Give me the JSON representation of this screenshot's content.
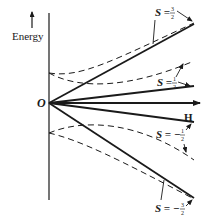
{
  "diagram": {
    "type": "zeeman-energy-level-splitting",
    "axes": {
      "y_label": "Energy",
      "x_label": "H",
      "origin_label": "O"
    },
    "levels": [
      {
        "label_prefix": "S = ",
        "sign": "",
        "num": "3",
        "den": "2",
        "style": "solid",
        "note": "linear, steepest rising"
      },
      {
        "label_prefix": "S = ",
        "sign": "",
        "num": "1",
        "den": "2",
        "style": "solid",
        "note": "linear, shallow rising"
      },
      {
        "label_prefix": "S = ",
        "sign": "−",
        "num": "1",
        "den": "2",
        "style": "solid",
        "note": "linear, shallow falling"
      },
      {
        "label_prefix": "S = ",
        "sign": "−",
        "num": "3",
        "den": "2",
        "style": "solid",
        "note": "linear, steepest falling"
      }
    ],
    "dashed_curves": [
      {
        "description": "upper pair: curves starting on energy axis above O, bending toward S=3/2 and S=1/2 lines"
      },
      {
        "description": "lower pair: curves starting on energy axis below O, bending toward S=-1/2 and S=-3/2 lines"
      }
    ],
    "colors": {
      "ink": "#1a1a1a",
      "background": "#ffffff"
    }
  }
}
